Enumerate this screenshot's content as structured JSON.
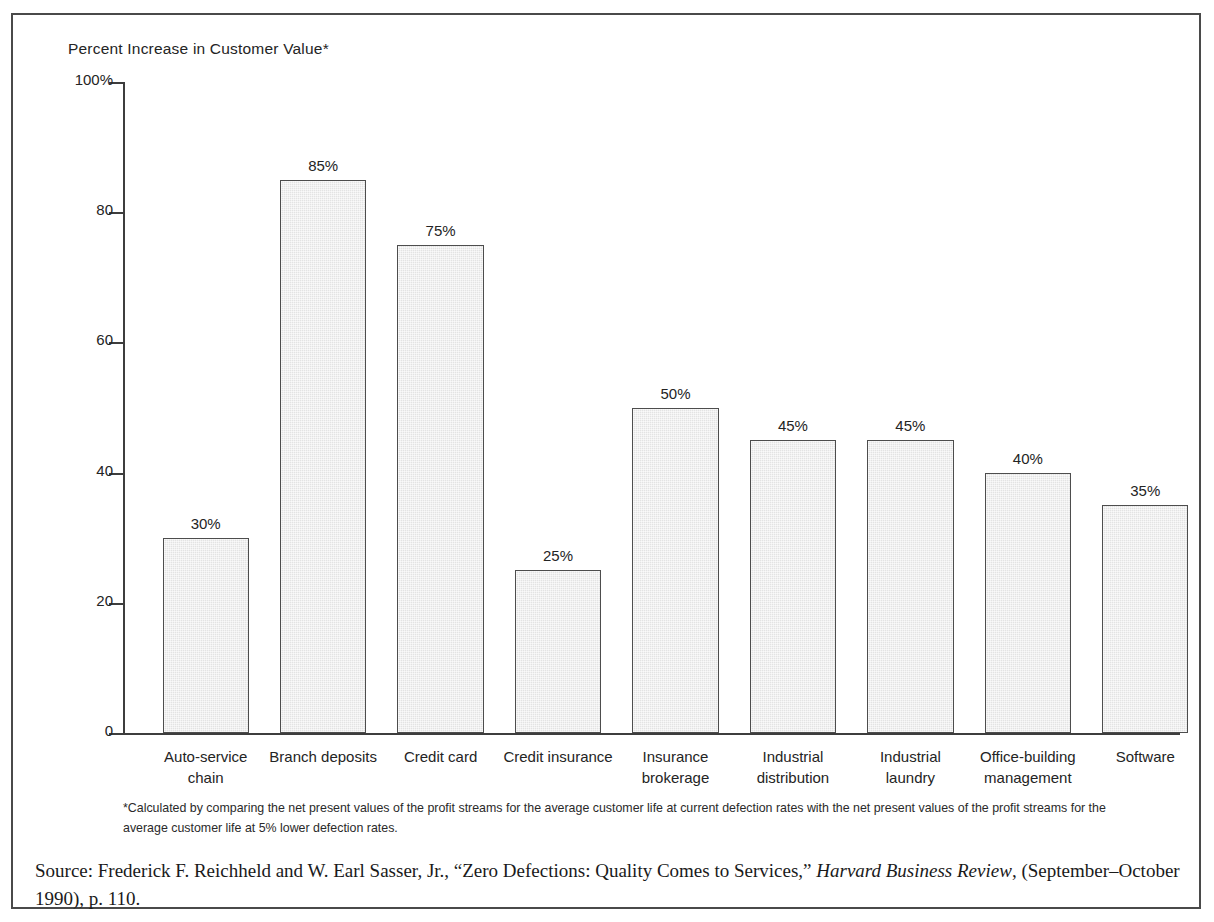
{
  "chart_data": {
    "type": "bar",
    "title": "Percent Increase in Customer Value*",
    "xlabel": "",
    "ylabel": "Percent Increase in Customer Value",
    "ylim": [
      0,
      100
    ],
    "grid": false,
    "legend": "none",
    "y_ticks": [
      "100%",
      "80",
      "60",
      "40",
      "20",
      "0"
    ],
    "y_tick_values": [
      100,
      80,
      60,
      40,
      20,
      0
    ],
    "categories": [
      "Auto-service chain",
      "Branch deposits",
      "Credit card",
      "Credit insurance",
      "Insurance brokerage",
      "Industrial distribution",
      "Industrial laundry",
      "Office-building management",
      "Software"
    ],
    "category_lines": [
      [
        "Auto-service",
        "chain"
      ],
      [
        "Branch deposits"
      ],
      [
        "Credit card"
      ],
      [
        "Credit insurance"
      ],
      [
        "Insurance",
        "brokerage"
      ],
      [
        "Industrial",
        "distribution"
      ],
      [
        "Industrial",
        "laundry"
      ],
      [
        "Office-building",
        "management"
      ],
      [
        "Software"
      ]
    ],
    "values": [
      30,
      85,
      75,
      25,
      50,
      45,
      45,
      40,
      35
    ],
    "value_labels": [
      "30%",
      "85%",
      "75%",
      "25%",
      "50%",
      "45%",
      "45%",
      "40%",
      "35%"
    ],
    "bar_fill_color": "#e3e3e3",
    "bar_border_color": "#4d4d4d",
    "axis_color": "#3d3d3d"
  },
  "footnote": "*Calculated by comparing the net present values of the profit streams for the average customer life at current defection rates with the net present values of the profit streams for the average customer life at 5% lower defection rates.",
  "source": {
    "prefix": "Source: Frederick F. Reichheld and W. Earl Sasser, Jr., “Zero Defections: Quality Comes to Services,” ",
    "publication": "Harvard Business Review",
    "suffix": ", (September–October 1990), p. 110."
  }
}
